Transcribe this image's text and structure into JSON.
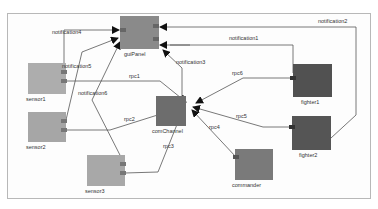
{
  "diagram": {
    "components": [
      {
        "id": "guiPanel",
        "label": "guiPanel",
        "x": 120,
        "y": 16,
        "w": 39,
        "h": 33,
        "color": "#8a8a8a"
      },
      {
        "id": "sensor1",
        "label": "sensor1",
        "x": 28,
        "y": 63,
        "w": 38,
        "h": 31,
        "color": "#adadad"
      },
      {
        "id": "sensor2",
        "label": "sensor2",
        "x": 28,
        "y": 112,
        "w": 38,
        "h": 30,
        "color": "#a6a6a6"
      },
      {
        "id": "sensor3",
        "label": "sensor3",
        "x": 87,
        "y": 155,
        "w": 38,
        "h": 31,
        "color": "#a8a8a8"
      },
      {
        "id": "comChannel",
        "label": "comChannel",
        "x": 156,
        "y": 96,
        "w": 30,
        "h": 30,
        "color": "#6d6d6d"
      },
      {
        "id": "fighter1",
        "label": "fighter1",
        "x": 293,
        "y": 64,
        "w": 39,
        "h": 33,
        "color": "#515151"
      },
      {
        "id": "fighter2",
        "label": "fighter2",
        "x": 292,
        "y": 116,
        "w": 39,
        "h": 34,
        "color": "#555555"
      },
      {
        "id": "commander",
        "label": "commander",
        "x": 235,
        "y": 149,
        "w": 38,
        "h": 31,
        "color": "#7a7a7a"
      }
    ],
    "connections": [
      {
        "label": "notification4",
        "from": "sensor1",
        "to": "guiPanel"
      },
      {
        "label": "notification5",
        "from": "sensor2",
        "to": "guiPanel"
      },
      {
        "label": "notification6",
        "from": "sensor3",
        "to": "guiPanel"
      },
      {
        "label": "notification1",
        "from": "fighter1",
        "to": "guiPanel"
      },
      {
        "label": "notification2",
        "from": "fighter2",
        "to": "guiPanel"
      },
      {
        "label": "notification3",
        "from": "comChannel",
        "to": "guiPanel"
      },
      {
        "label": "rpc1",
        "from": "sensor1",
        "to": "comChannel"
      },
      {
        "label": "rpc2",
        "from": "sensor2",
        "to": "comChannel"
      },
      {
        "label": "rpc3",
        "from": "sensor3",
        "to": "comChannel"
      },
      {
        "label": "rpc4",
        "from": "commander",
        "to": "comChannel"
      },
      {
        "label": "rpc5",
        "from": "fighter2",
        "to": "comChannel"
      },
      {
        "label": "rpc6",
        "from": "fighter1",
        "to": "comChannel"
      }
    ]
  }
}
